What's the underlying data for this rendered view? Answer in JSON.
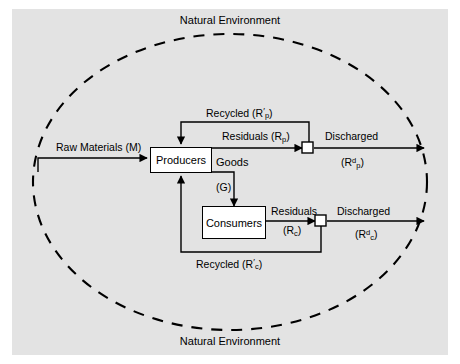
{
  "figure": {
    "title_top": "Natural Environment",
    "title_bottom": "Natural Environment",
    "background_color": "#e3e3e3",
    "line_color": "#000000",
    "box_fill": "#ffffff"
  },
  "boundary": {
    "name": "natural-environment-boundary",
    "style": "dashed-ellipse"
  },
  "nodes": [
    {
      "id": "producers",
      "label": "Producers"
    },
    {
      "id": "consumers",
      "label": "Consumers"
    },
    {
      "id": "junction-producers",
      "label": ""
    },
    {
      "id": "junction-consumers",
      "label": ""
    }
  ],
  "flows": {
    "raw_materials": "Raw Materials (M)",
    "recycled_producers": {
      "text": "Recycled (R",
      "prime": "′",
      "sub": "p",
      "close": ")"
    },
    "residuals_producers": {
      "text": "Residuals (R",
      "sub": "p",
      "close": ")"
    },
    "discharged_producers_line1": "Discharged",
    "discharged_producers_line2": {
      "open": "(R",
      "sup": "d",
      "sub": "p",
      "close": ")"
    },
    "goods_word": "Goods",
    "goods_symbol": "(G)",
    "residuals_consumers_line1": "Residuals",
    "residuals_consumers_line2": {
      "open": "(R",
      "sub": "c",
      "close": ")"
    },
    "discharged_consumers_line1": "Discharged",
    "discharged_consumers_line2": {
      "open": "(R",
      "sup": "d",
      "sub": "c",
      "close": ")"
    },
    "recycled_consumers": {
      "text": "Recycled (R",
      "prime": "′",
      "sub": "c",
      "close": ")"
    }
  }
}
